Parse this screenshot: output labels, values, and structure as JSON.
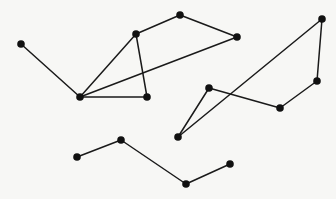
{
  "figure": {
    "width": 336,
    "height": 199,
    "background_color": "#f7f7f5",
    "edge_color": "#1a1a1a",
    "node_color": "#111111",
    "edge_width": 1.5,
    "node_radius": 3.8
  },
  "chart_data": {
    "type": "scatter",
    "title": "",
    "xlabel": "",
    "ylabel": "",
    "xlim": [
      0,
      336
    ],
    "ylim": [
      0,
      199
    ],
    "grid": false,
    "legend": "none",
    "nodes": [
      {
        "id": "n0",
        "label": "",
        "x": 21,
        "y": 44
      },
      {
        "id": "n1",
        "label": "",
        "x": 80,
        "y": 97
      },
      {
        "id": "n2",
        "label": "",
        "x": 136,
        "y": 34
      },
      {
        "id": "n3",
        "label": "",
        "x": 180,
        "y": 15
      },
      {
        "id": "n4",
        "label": "",
        "x": 237,
        "y": 37
      },
      {
        "id": "n5",
        "label": "",
        "x": 147,
        "y": 97
      },
      {
        "id": "n6",
        "label": "",
        "x": 322,
        "y": 19
      },
      {
        "id": "n7",
        "label": "",
        "x": 317,
        "y": 81
      },
      {
        "id": "n8",
        "label": "",
        "x": 280,
        "y": 108
      },
      {
        "id": "n9",
        "label": "",
        "x": 209,
        "y": 88
      },
      {
        "id": "n10",
        "label": "",
        "x": 178,
        "y": 137
      },
      {
        "id": "n11",
        "label": "",
        "x": 77,
        "y": 157
      },
      {
        "id": "n12",
        "label": "",
        "x": 121,
        "y": 140
      },
      {
        "id": "n13",
        "label": "",
        "x": 186,
        "y": 184
      },
      {
        "id": "n14",
        "label": "",
        "x": 230,
        "y": 164
      }
    ],
    "edges": [
      {
        "source": "n0",
        "target": "n1"
      },
      {
        "source": "n1",
        "target": "n2"
      },
      {
        "source": "n1",
        "target": "n4"
      },
      {
        "source": "n1",
        "target": "n5"
      },
      {
        "source": "n2",
        "target": "n3"
      },
      {
        "source": "n2",
        "target": "n5"
      },
      {
        "source": "n3",
        "target": "n4"
      },
      {
        "source": "n6",
        "target": "n7"
      },
      {
        "source": "n6",
        "target": "n10"
      },
      {
        "source": "n7",
        "target": "n8"
      },
      {
        "source": "n8",
        "target": "n9"
      },
      {
        "source": "n9",
        "target": "n10"
      },
      {
        "source": "n11",
        "target": "n12"
      },
      {
        "source": "n12",
        "target": "n13"
      },
      {
        "source": "n13",
        "target": "n14"
      }
    ],
    "components": [
      {
        "name": "upper-left-component",
        "node_count": 6,
        "nodes": [
          "n0",
          "n1",
          "n2",
          "n3",
          "n4",
          "n5"
        ]
      },
      {
        "name": "right-component",
        "node_count": 5,
        "nodes": [
          "n6",
          "n7",
          "n8",
          "n9",
          "n10"
        ]
      },
      {
        "name": "bottom-zigzag-chain",
        "node_count": 4,
        "nodes": [
          "n11",
          "n12",
          "n13",
          "n14"
        ]
      }
    ]
  }
}
